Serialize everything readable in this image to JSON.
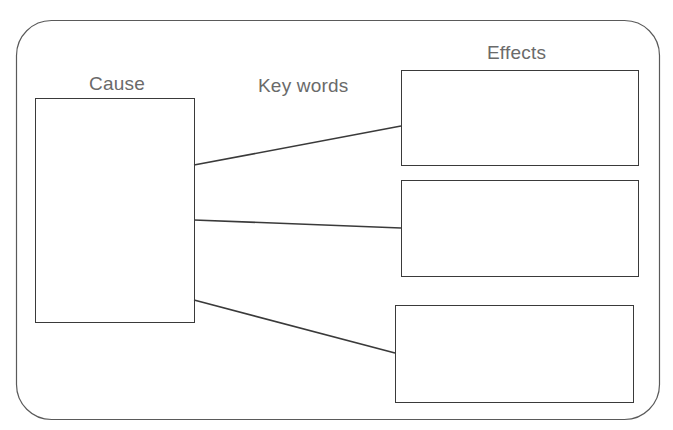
{
  "diagram": {
    "type": "cause-effect graphic organizer",
    "labels": {
      "cause": "Cause",
      "keywords": "Key words",
      "effects": "Effects"
    },
    "cause_box": {
      "text": ""
    },
    "effect_boxes": [
      {
        "text": ""
      },
      {
        "text": ""
      },
      {
        "text": ""
      }
    ],
    "connectors": [
      {
        "from": "cause",
        "to": "effect-1"
      },
      {
        "from": "cause",
        "to": "effect-2"
      },
      {
        "from": "cause",
        "to": "effect-3"
      }
    ],
    "colors": {
      "stroke": "#3a3a3a",
      "frame_stroke": "#5a5a5a",
      "label_text": "#6a6a6a",
      "background": "#ffffff"
    }
  }
}
